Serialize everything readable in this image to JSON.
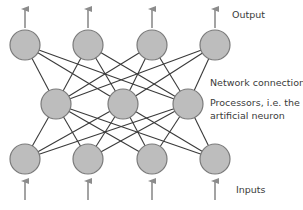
{
  "diagram": {
    "type": "neural-network",
    "colors": {
      "node_fill": "#bdbdbd",
      "node_stroke": "#7a7a7a",
      "edge": "#3a3a3a",
      "arrow": "#8c8c8c",
      "text": "#3a3a3a"
    },
    "node_radius": 15,
    "layers": [
      {
        "name": "output",
        "y": 45,
        "x": [
          25,
          88,
          152,
          215
        ]
      },
      {
        "name": "hidden",
        "y": 104,
        "x": [
          56,
          123,
          188
        ]
      },
      {
        "name": "input",
        "y": 159,
        "x": [
          25,
          88,
          152,
          215
        ]
      }
    ],
    "connections": "fully-connected between adjacent layers",
    "arrows": {
      "output": {
        "from_y": 28,
        "to_y": 5
      },
      "input": {
        "from_y": 200,
        "to_y": 177
      }
    }
  },
  "labels": {
    "output": "Output",
    "network_connection": "Network connection",
    "processors_line1": "Processors, i.e. the",
    "processors_line2": "artificial neuron",
    "inputs": "Inputs"
  }
}
